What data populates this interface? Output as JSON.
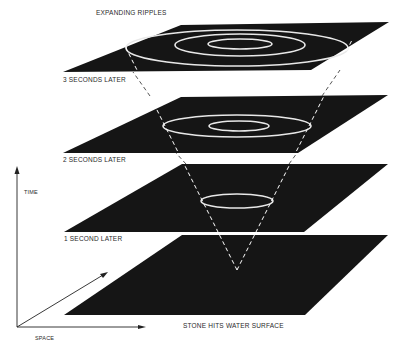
{
  "title": "EXPANDING RIPPLES",
  "planes": [
    {
      "label": "3 SECONDS LATER",
      "time_s": 3
    },
    {
      "label": "2 SECONDS LATER",
      "time_s": 2
    },
    {
      "label": "1 SECOND LATER",
      "time_s": 1
    },
    {
      "label": "STONE HITS WATER SURFACE",
      "time_s": 0
    }
  ],
  "axes": {
    "time_label": "TIME",
    "space_label": "SPACE"
  },
  "colors": {
    "plane": "#151515",
    "ripple": "#e8e8e8",
    "cone": "#ffffff",
    "axis": "#222222",
    "background": "#ffffff"
  }
}
